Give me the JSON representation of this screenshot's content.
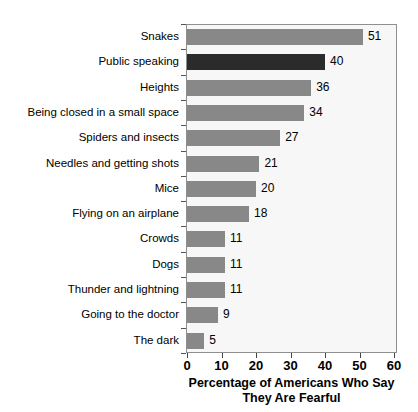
{
  "chart_data": {
    "type": "bar",
    "orientation": "horizontal",
    "title": "",
    "xlabel_line1": "Percentage of Americans Who Say",
    "xlabel_line2": "They Are Fearful",
    "ylabel": "",
    "xlim": [
      0,
      60
    ],
    "xticks": [
      0,
      10,
      20,
      30,
      40,
      50,
      60
    ],
    "xtick_labels": [
      "0",
      "10",
      "20",
      "30",
      "40",
      "50",
      "60"
    ],
    "grid": false,
    "legend": "none",
    "bar_color": "#888888",
    "highlight_color": "#2b2b2b",
    "plot_background": "#f7f7f7",
    "frame_color": "#8f8f8f",
    "categories": [
      "Snakes",
      "Public speaking",
      "Heights",
      "Being closed in a small space",
      "Spiders and insects",
      "Needles and getting shots",
      "Mice",
      "Flying on an airplane",
      "Crowds",
      "Dogs",
      "Thunder and lightning",
      "Going to the doctor",
      "The dark"
    ],
    "values": [
      51,
      40,
      36,
      34,
      27,
      21,
      20,
      18,
      11,
      11,
      11,
      9,
      5
    ],
    "value_labels": [
      "51",
      "40",
      "36",
      "34",
      "27",
      "21",
      "20",
      "18",
      "11",
      "11",
      "11",
      "9",
      "5"
    ],
    "highlighted_index": 1
  }
}
